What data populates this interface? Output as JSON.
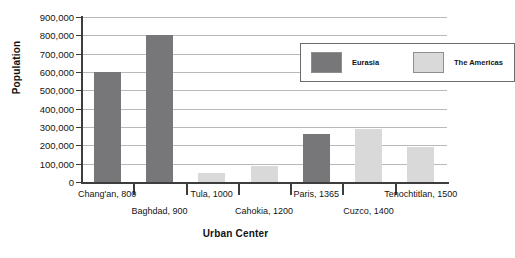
{
  "chart_data": {
    "type": "bar",
    "title": "",
    "xlabel": "Urban Center",
    "ylabel": "Population",
    "ylim": [
      0,
      900000
    ],
    "grid": true,
    "legend_position": "inside-top-right",
    "categories": [
      "Chang'an, 800",
      "Baghdad, 900",
      "Tula, 1000",
      "Cahokia, 1200",
      "Paris, 1365",
      "Cuzco, 1400",
      "Tenochtitlan, 1500"
    ],
    "values": [
      600000,
      800000,
      50000,
      90000,
      260000,
      290000,
      190000
    ],
    "point_groups": [
      "Eurasia",
      "Eurasia",
      "The Americas",
      "The Americas",
      "Eurasia",
      "The Americas",
      "The Americas"
    ],
    "series": [
      {
        "name": "Eurasia",
        "color": "#77777a",
        "points": [
          {
            "category": "Chang'an, 800",
            "value": 600000
          },
          {
            "category": "Baghdad, 900",
            "value": 800000
          },
          {
            "category": "Paris, 1365",
            "value": 260000
          }
        ]
      },
      {
        "name": "The Americas",
        "color": "#d9d9d9",
        "points": [
          {
            "category": "Tula, 1000",
            "value": 50000
          },
          {
            "category": "Cahokia, 1200",
            "value": 90000
          },
          {
            "category": "Cuzco, 1400",
            "value": 290000
          },
          {
            "category": "Tenochtitlan, 1500",
            "value": 190000
          }
        ]
      }
    ],
    "ytick_labels": [
      "900,000",
      "800,000",
      "700,000",
      "600,000",
      "500,000",
      "400,000",
      "300,000",
      "200,000",
      "100,000",
      "0"
    ],
    "ytick_values": [
      900000,
      800000,
      700000,
      600000,
      500000,
      400000,
      300000,
      200000,
      100000,
      0
    ]
  },
  "legend": {
    "entries": [
      {
        "label": "Eurasia",
        "color": "#77777a"
      },
      {
        "label": "The Americas",
        "color": "#d9d9d9"
      }
    ]
  },
  "axes": {
    "y_title": "Population",
    "x_title": "Urban Center"
  }
}
